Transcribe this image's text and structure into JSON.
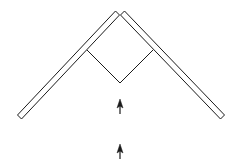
{
  "diagram": {
    "background": "#ffffff",
    "stroke_color": "#1a1a1a",
    "elements": {
      "left_mirror": {
        "from": [
          19,
          117
        ],
        "to": [
          118,
          12
        ],
        "thickness": 6
      },
      "right_mirror": {
        "from": [
          122,
          12
        ],
        "to": [
          223,
          117
        ],
        "thickness": 6
      },
      "inner_path": {
        "points": [
          [
            87,
            50
          ],
          [
            120,
            83
          ],
          [
            153,
            50
          ]
        ]
      },
      "arrows": [
        {
          "x": 120,
          "tail_y": 114,
          "head_y": 100,
          "direction": "up"
        },
        {
          "x": 120,
          "tail_y": 159,
          "head_y": 144,
          "direction": "up"
        }
      ]
    }
  }
}
